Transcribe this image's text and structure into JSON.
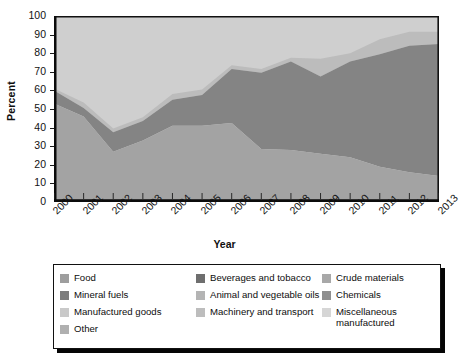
{
  "chart_data": {
    "type": "area",
    "title": "",
    "xlabel": "Year",
    "ylabel": "Percent",
    "ylim": [
      0,
      100
    ],
    "yticks": [
      0,
      10,
      20,
      30,
      40,
      50,
      60,
      70,
      80,
      90,
      100
    ],
    "grid": false,
    "legend_position": "bottom",
    "stacked": true,
    "categories": [
      "2000",
      "2001",
      "2002",
      "2003",
      "2004",
      "2005",
      "2006",
      "2007",
      "2008",
      "2009",
      "2010",
      "2011",
      "2012",
      "2013"
    ],
    "series": [
      {
        "name": "Food",
        "color": "#9e9e9e",
        "values": [
          53,
          46,
          27,
          33,
          41,
          41,
          42.5,
          28.5,
          28,
          26,
          24,
          19,
          16,
          14
        ]
      },
      {
        "name": "Beverages and tobacco",
        "color": "#6e6e6e",
        "values": [
          0.6,
          0.6,
          0.6,
          0.6,
          0.6,
          0.6,
          0.6,
          0.6,
          0.6,
          0.6,
          0.6,
          0.6,
          0.6,
          0.6
        ]
      },
      {
        "name": "Crude materials",
        "color": "#a8a8a8",
        "values": [
          0.5,
          0.5,
          0.5,
          0.5,
          0.5,
          0.5,
          0.5,
          0.5,
          0.5,
          0.5,
          0.5,
          0.5,
          0.5,
          0.5
        ]
      },
      {
        "name": "Mineral fuels",
        "color": "#7d7d7d",
        "values": [
          5.4,
          3.9,
          9.4,
          9.4,
          12.9,
          15.9,
          28.4,
          40.4,
          46.9,
          40.9,
          50.9,
          59.9,
          66.9,
          69.9
        ]
      },
      {
        "name": "Animal and vegetable oils",
        "color": "#b4b4b4",
        "values": [
          0.5,
          0.5,
          0.5,
          0.5,
          0.5,
          0.5,
          0.5,
          0.5,
          0.5,
          0.5,
          0.5,
          0.5,
          0.5,
          0.5
        ]
      },
      {
        "name": "Chemicals",
        "color": "#8f8f8f",
        "values": [
          0.5,
          0.5,
          0.5,
          0.5,
          0.5,
          0.5,
          0.5,
          0.5,
          0.5,
          0.5,
          0.5,
          0.5,
          0.5,
          0.5
        ]
      },
      {
        "name": "Manufactured goods",
        "color": "#c9c9c9",
        "values": [
          0.5,
          0.5,
          0.5,
          0.5,
          0.5,
          0.5,
          0.5,
          0.5,
          0.5,
          0.5,
          0.5,
          0.5,
          0.5,
          0.5
        ]
      },
      {
        "name": "Machinery and transport",
        "color": "#bdbdbd",
        "values": [
          0.5,
          1.5,
          1.0,
          1.0,
          2.0,
          1.5,
          0.5,
          0.5,
          0.5,
          7.5,
          3.0,
          6.0,
          6.0,
          5.5
        ]
      },
      {
        "name": "Miscellaneous manufactured",
        "color": "#d6d6d6",
        "values": [
          39.0,
          46.5,
          60.5,
          54.5,
          42.0,
          39.5,
          26.5,
          28.5,
          22.5,
          23.0,
          20.0,
          12.5,
          8.5,
          8.5
        ]
      },
      {
        "name": "Other",
        "color": "#b0b0b0",
        "values": [
          0,
          0,
          0,
          0,
          0,
          0,
          0,
          0,
          0,
          0,
          0,
          0,
          0,
          0
        ]
      }
    ],
    "boundaries_percent": {
      "food_top": [
        53,
        46,
        27,
        33,
        41,
        41,
        42.5,
        28.5,
        28,
        26,
        24,
        19,
        16,
        14
      ],
      "mineral_top": [
        60,
        50.5,
        37.5,
        43.5,
        55,
        57.5,
        71.5,
        69.5,
        75.5,
        67.5,
        75.5,
        79.5,
        84,
        85
      ],
      "machinery_top": [
        61,
        53.5,
        39.5,
        45.5,
        58,
        60.5,
        73.5,
        71.5,
        77.5,
        77,
        80,
        87.5,
        91.5,
        91.5
      ],
      "total": [
        100,
        100,
        100,
        100,
        100,
        100,
        100,
        100,
        100,
        100,
        100,
        100,
        100,
        100
      ]
    }
  },
  "axes": {
    "y_title": "Percent",
    "x_title": "Year",
    "y_tick_labels": [
      "100",
      "90",
      "80",
      "70",
      "60",
      "50",
      "40",
      "30",
      "20",
      "10",
      "0"
    ],
    "x_tick_labels": [
      "2000",
      "2001",
      "2002",
      "2003",
      "2004",
      "2005",
      "2006",
      "2007",
      "2008",
      "2009",
      "2010",
      "2011",
      "2012",
      "2013"
    ]
  },
  "legend": {
    "columns": [
      [
        {
          "label": "Food",
          "color": "#9e9e9e"
        },
        {
          "label": "Mineral fuels",
          "color": "#7d7d7d"
        },
        {
          "label": "Manufactured goods",
          "color": "#c9c9c9"
        },
        {
          "label": "Other",
          "color": "#b0b0b0"
        }
      ],
      [
        {
          "label": "Beverages and tobacco",
          "color": "#6e6e6e"
        },
        {
          "label": "Animal and vegetable oils",
          "color": "#b4b4b4"
        },
        {
          "label": "Machinery and transport",
          "color": "#bdbdbd"
        }
      ],
      [
        {
          "label": "Crude materials",
          "color": "#a8a8a8"
        },
        {
          "label": "Chemicals",
          "color": "#8f8f8f"
        },
        {
          "label": "Miscellaneous\nmanufactured",
          "color": "#d6d6d6"
        }
      ]
    ]
  },
  "style": {
    "plot_background": "#c6c6c6",
    "axis_color": "#111111",
    "legend_border": "#111111",
    "legend_shadow": "#050505"
  }
}
